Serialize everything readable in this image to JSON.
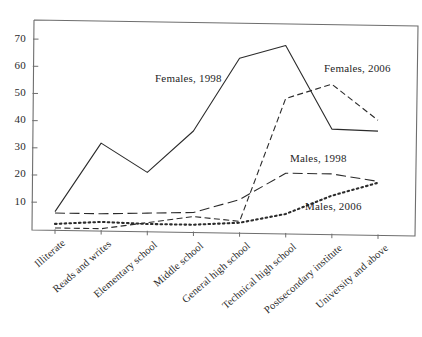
{
  "chart_data": {
    "type": "line",
    "title": "",
    "subtitle": "",
    "xlabel": "",
    "ylabel": "",
    "categories": [
      "Illiterate",
      "Reads and writes",
      "Elementary school",
      "Middle school",
      "General high school",
      "Technical high school",
      "Postsecondary institute",
      "University and above"
    ],
    "ylim": [
      0,
      78
    ],
    "yticks": [
      10,
      20,
      30,
      40,
      50,
      60,
      70
    ],
    "ytick_labels": [
      "10",
      "20",
      "30",
      "40",
      "50",
      "60",
      "70"
    ],
    "grid": false,
    "legend_position": "inline-annotations",
    "series": [
      {
        "name": "Females, 1998",
        "style": "solid",
        "color": "#2b2b2b",
        "values": [
          6.5,
          32,
          21.5,
          37,
          64,
          69,
          38.5,
          38
        ]
      },
      {
        "name": "Females, 2006",
        "style": "dashed",
        "color": "#2b2b2b",
        "values": [
          0.5,
          0.5,
          3,
          5.5,
          4,
          49.5,
          55,
          42
        ]
      },
      {
        "name": "Males, 1998",
        "style": "long-dash",
        "color": "#2b2b2b",
        "values": [
          6,
          6,
          6.5,
          7,
          12,
          22,
          22,
          19.5
        ]
      },
      {
        "name": "Males, 2006",
        "style": "dotted",
        "color": "#2b2b2b",
        "values": [
          2,
          3,
          2.5,
          2.5,
          3.5,
          7,
          14,
          19
        ]
      }
    ],
    "annotations": [
      {
        "text": "Females, 1998",
        "series": "Females, 1998",
        "x": 155,
        "y": 72
      },
      {
        "text": "Females, 2006",
        "series": "Females, 2006",
        "x": 324,
        "y": 62
      },
      {
        "text": "Males, 1998",
        "series": "Males, 1998",
        "x": 290,
        "y": 152
      },
      {
        "text": "Males, 2006",
        "series": "Males, 2006",
        "x": 305,
        "y": 200
      }
    ]
  }
}
